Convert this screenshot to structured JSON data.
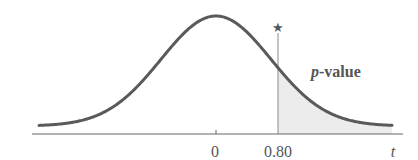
{
  "chart_data": {
    "type": "area",
    "title": "",
    "xlabel": "t",
    "ylabel": "",
    "x_ticks": [
      {
        "value": 0,
        "label": "0"
      },
      {
        "value": 0.8,
        "label": "0.80"
      }
    ],
    "center": 0,
    "observed_statistic": 0.8,
    "observed_marker": "★",
    "shaded_region": {
      "from": 0.8,
      "to": "+inf",
      "label": "p-value"
    },
    "grid": false,
    "legend": null
  },
  "labels": {
    "axis_variable": "t",
    "tick_zero": "0",
    "tick_observed": "0.80",
    "region_p": "p",
    "region_rest": "-value",
    "star": "★"
  },
  "colors": {
    "curve": "#5a5a5a",
    "axis": "#666666",
    "shade": "#ececec",
    "marker_line": "#8a8a8a",
    "text": "#555555"
  }
}
